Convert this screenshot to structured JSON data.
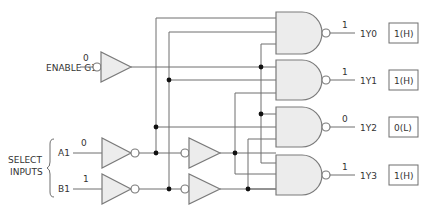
{
  "inputs": {
    "enable": {
      "label": "ENABLE G1",
      "level": "0"
    },
    "select_group_label_line1": "SELECT",
    "select_group_label_line2": "INPUTS",
    "a": {
      "label": "A1",
      "level": "0"
    },
    "b": {
      "label": "B1",
      "level": "1"
    }
  },
  "outputs": [
    {
      "label": "1Y0",
      "level": "1",
      "state": "1(H)"
    },
    {
      "label": "1Y1",
      "level": "1",
      "state": "1(H)"
    },
    {
      "label": "1Y2",
      "level": "0",
      "state": "0(L)"
    },
    {
      "label": "1Y3",
      "level": "1",
      "state": "1(H)"
    }
  ],
  "colors": {
    "wire": "#6e6e6e",
    "gate_fill": "#ececec",
    "junction": "#111111"
  }
}
